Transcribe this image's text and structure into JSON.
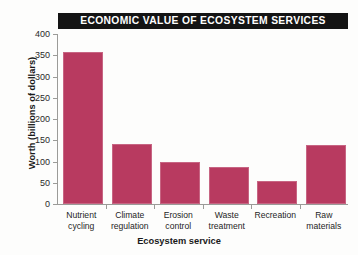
{
  "chart_data": {
    "type": "bar",
    "title": "ECONOMIC VALUE OF ECOSYSTEM SERVICES",
    "xlabel": "Ecosystem service",
    "ylabel": "Worth (billions of dollars)",
    "categories": [
      "Nutrient cycling",
      "Climate regulation",
      "Erosion control",
      "Waste treatment",
      "Recreation",
      "Raw materials"
    ],
    "category_lines": [
      [
        "Nutrient",
        "cycling"
      ],
      [
        "Climate",
        "regulation"
      ],
      [
        "Erosion",
        "control"
      ],
      [
        "Waste",
        "treatment"
      ],
      [
        "Recreation",
        ""
      ],
      [
        "Raw",
        "materials"
      ]
    ],
    "values": [
      358,
      142,
      98,
      88,
      53,
      138
    ],
    "ylim": [
      0,
      400
    ],
    "yticks": [
      0,
      50,
      100,
      150,
      200,
      250,
      300,
      350,
      400
    ],
    "ytick_labels": [
      "0",
      "50",
      "100",
      "150",
      "200",
      "250",
      "300",
      "350",
      "400"
    ],
    "grid": false,
    "legend": "none",
    "bar_color": "#b83a60",
    "title_bar_color": "#141414",
    "title_text_color": "#ffffff",
    "axis_color": "#9b9b98",
    "background_color": "#fdfdfc"
  }
}
